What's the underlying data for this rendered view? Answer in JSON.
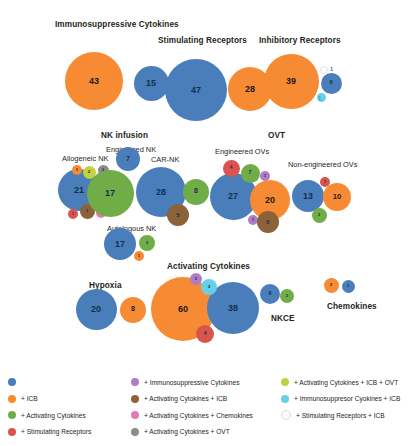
{
  "figure": {
    "title": "",
    "width": 420,
    "height": 446
  },
  "colors": {
    "blue": "#4a7ebb",
    "orange": "#f68b33",
    "green": "#70ad47",
    "red": "#d9534f",
    "purple": "#b07cc6",
    "brown": "#8c6239",
    "pink": "#e07ab0",
    "gray": "#8c8c8c",
    "yellow_green": "#c3d13f",
    "cyan": "#67d0e8",
    "white": "#fdfdfd"
  },
  "group_labels": [
    {
      "text": "Immunosuppressive Cytokines",
      "x": 55,
      "y": 20,
      "type": "main"
    },
    {
      "text": "Stimulating Receptors",
      "x": 158,
      "y": 36,
      "type": "main"
    },
    {
      "text": "Inhibitory Receptors",
      "x": 259,
      "y": 36,
      "type": "main"
    },
    {
      "text": "NK infusion",
      "x": 101,
      "y": 131,
      "type": "main"
    },
    {
      "text": "OVT",
      "x": 268,
      "y": 131,
      "type": "main"
    },
    {
      "text": "Activating Cytokines",
      "x": 167,
      "y": 262,
      "type": "main"
    },
    {
      "text": "Chemokines",
      "x": 327,
      "y": 302,
      "type": "main"
    },
    {
      "text": "NKCE",
      "x": 271,
      "y": 314,
      "type": "main"
    },
    {
      "text": "Hypoxia",
      "x": 89,
      "y": 281,
      "type": "main"
    },
    {
      "text": "Engineered NK",
      "x": 106,
      "y": 145,
      "type": "sub"
    },
    {
      "text": "Allogeneic NK",
      "x": 62,
      "y": 154,
      "type": "sub"
    },
    {
      "text": "CAR-NK",
      "x": 151,
      "y": 155,
      "type": "sub"
    },
    {
      "text": "Engineered OVs",
      "x": 215,
      "y": 147,
      "type": "sub"
    },
    {
      "text": "Non-engineered OVs",
      "x": 288,
      "y": 160,
      "type": "sub"
    },
    {
      "text": "Autologous NK",
      "x": 107,
      "y": 224,
      "type": "sub"
    }
  ],
  "chart_data": {
    "type": "bubble",
    "title": "",
    "xlabel": "",
    "ylabel": "",
    "grid": false,
    "legend_position": "bottom",
    "value_encoding": "bubble area proportional to count",
    "bubbles": [
      {
        "group": "Immunosuppressive Cytokines",
        "category": "base",
        "value": 43,
        "color": "orange",
        "cx": 94,
        "cy": 81,
        "r": 29
      },
      {
        "group": "Immunosuppressive Cytokines",
        "category": "+ ICB",
        "value": 15,
        "color": "blue",
        "cx": 151,
        "cy": 83,
        "r": 17.5
      },
      {
        "group": "Stimulating Receptors",
        "category": "base",
        "value": 47,
        "color": "blue",
        "cx": 196,
        "cy": 90,
        "r": 31
      },
      {
        "group": "Stimulating Receptors",
        "category": "+ ICB",
        "value": 28,
        "color": "orange",
        "cx": 250,
        "cy": 89,
        "r": 22
      },
      {
        "group": "Inhibitory Receptors",
        "category": "base",
        "value": 39,
        "color": "orange",
        "cx": 291,
        "cy": 81,
        "r": 27.5
      },
      {
        "group": "Inhibitory Receptors",
        "category": "+ ICB",
        "value": 6,
        "color": "blue",
        "cx": 331,
        "cy": 83,
        "r": 10.5
      },
      {
        "group": "Inhibitory Receptors",
        "category": "+ Stimulating Receptors + ICB",
        "value": 1,
        "color": "white",
        "cx": 324,
        "cy": 70,
        "r": 4,
        "label_outside": true,
        "label_x": 330,
        "label_y": 66
      },
      {
        "group": "Inhibitory Receptors",
        "category": "+ Immunosuppresor Cyokines + ICB",
        "value": 1,
        "color": "cyan",
        "cx": 321,
        "cy": 97,
        "r": 4.5,
        "label_outside": true,
        "label_x": 318,
        "label_y": 95,
        "label_cyan": true
      },
      {
        "group": "Allogeneic NK",
        "category": "base",
        "value": 21,
        "color": "blue",
        "cx": 79,
        "cy": 190,
        "r": 21
      },
      {
        "group": "Allogeneic NK",
        "category": "+ ICB",
        "value": 1,
        "color": "orange",
        "cx": 77,
        "cy": 170,
        "r": 5
      },
      {
        "group": "Allogeneic NK",
        "category": "+ Activating Cytokines + ICB + OVT",
        "value": 2,
        "color": "yellow_green",
        "cx": 89,
        "cy": 172,
        "r": 6.5
      },
      {
        "group": "Allogeneic NK",
        "category": "+ Activating Cytokines + OVT",
        "value": 3,
        "color": "gray",
        "cx": 103,
        "cy": 170,
        "r": 5.5
      },
      {
        "group": "Allogeneic NK",
        "category": "+ Stimulating Receptors",
        "value": 1,
        "color": "red",
        "cx": 73,
        "cy": 214,
        "r": 5
      },
      {
        "group": "Allogeneic NK",
        "category": "+ Activating Cytokines + ICB",
        "value": 3,
        "color": "brown",
        "cx": 87,
        "cy": 211,
        "r": 7.5
      },
      {
        "group": "Allogeneic NK",
        "category": "+ Activating Cytokines + Chemokines",
        "value": 1,
        "color": "pink",
        "cx": 101,
        "cy": 213,
        "r": 5
      },
      {
        "group": "Engineered NK",
        "category": "base",
        "value": 7,
        "color": "blue",
        "cx": 128,
        "cy": 159,
        "r": 12
      },
      {
        "group": "Engineered NK",
        "category": "+ Activating Cytokines",
        "value": 17,
        "color": "green",
        "cx": 110,
        "cy": 193,
        "r": 23.5
      },
      {
        "group": "CAR-NK",
        "category": "base",
        "value": 28,
        "color": "blue",
        "cx": 161,
        "cy": 192,
        "r": 25
      },
      {
        "group": "CAR-NK",
        "category": "+ Activating Cytokines",
        "value": 8,
        "color": "green",
        "cx": 196,
        "cy": 192,
        "r": 13
      },
      {
        "group": "CAR-NK",
        "category": "+ Activating Cytokines + ICB",
        "value": 5,
        "color": "brown",
        "cx": 178,
        "cy": 215,
        "r": 11
      },
      {
        "group": "Autologous NK",
        "category": "base",
        "value": 17,
        "color": "blue",
        "cx": 120,
        "cy": 244,
        "r": 16
      },
      {
        "group": "Autologous NK",
        "category": "+ Activating Cytokines",
        "value": 3,
        "color": "green",
        "cx": 147,
        "cy": 243,
        "r": 8
      },
      {
        "group": "Autologous NK",
        "category": "+ ICB",
        "value": 1,
        "color": "orange",
        "cx": 139,
        "cy": 256,
        "r": 5
      },
      {
        "group": "Engineered OVs",
        "category": "base",
        "value": 27,
        "color": "blue",
        "cx": 233,
        "cy": 196,
        "r": 23.5
      },
      {
        "group": "Engineered OVs",
        "category": "+ Stimulating Receptors",
        "value": 4,
        "color": "red",
        "cx": 231,
        "cy": 168,
        "r": 8.5
      },
      {
        "group": "Engineered OVs",
        "category": "+ Activating Cytokines",
        "value": 7,
        "color": "green",
        "cx": 250,
        "cy": 173,
        "r": 9.5
      },
      {
        "group": "Engineered OVs",
        "category": "+ Immunosuppressive Cytokines",
        "value": 1,
        "color": "purple",
        "cx": 265,
        "cy": 176,
        "r": 5
      },
      {
        "group": "Engineered OVs",
        "category": "+ ICB",
        "value": 20,
        "color": "orange",
        "cx": 270,
        "cy": 200,
        "r": 20
      },
      {
        "group": "Engineered OVs",
        "category": "+ Immunosuppressive Cytokines",
        "value": 1,
        "color": "purple",
        "cx": 253,
        "cy": 220,
        "r": 5
      },
      {
        "group": "Engineered OVs",
        "category": "+ Activating Cytokines + ICB",
        "value": 5,
        "color": "brown",
        "cx": 268,
        "cy": 222,
        "r": 11
      },
      {
        "group": "Non-engineered OVs",
        "category": "base",
        "value": 13,
        "color": "blue",
        "cx": 308,
        "cy": 196,
        "r": 16
      },
      {
        "group": "Non-engineered OVs",
        "category": "+ ICB",
        "value": 10,
        "color": "orange",
        "cx": 337,
        "cy": 197,
        "r": 14
      },
      {
        "group": "Non-engineered OVs",
        "category": "+ Stimulating Receptors",
        "value": 1,
        "color": "red",
        "cx": 325,
        "cy": 182,
        "r": 5
      },
      {
        "group": "Non-engineered OVs",
        "category": "+ Activating Cytokines",
        "value": 3,
        "color": "green",
        "cx": 319,
        "cy": 215,
        "r": 7.5
      },
      {
        "group": "Hypoxia",
        "category": "base",
        "value": 20,
        "color": "blue",
        "cx": 96,
        "cy": 309,
        "r": 20.5
      },
      {
        "group": "Hypoxia",
        "category": "+ ICB",
        "value": 8,
        "color": "orange",
        "cx": 133,
        "cy": 310,
        "r": 13
      },
      {
        "group": "Activating Cytokines",
        "category": "base",
        "value": 60,
        "color": "orange",
        "cx": 183,
        "cy": 309,
        "r": 32
      },
      {
        "group": "Activating Cytokines",
        "category": "+ ICB",
        "value": 38,
        "color": "blue",
        "cx": 233,
        "cy": 308,
        "r": 26
      },
      {
        "group": "Activating Cytokines",
        "category": "+ Immunosuppressive Cytokines",
        "value": 2,
        "color": "purple",
        "cx": 196,
        "cy": 279,
        "r": 6
      },
      {
        "group": "Activating Cytokines",
        "category": "+ Immunosuppresor Cyokines + ICB",
        "value": 3,
        "color": "cyan",
        "cx": 209,
        "cy": 287,
        "r": 8
      },
      {
        "group": "Activating Cytokines",
        "category": "+ Stimulating Receptors",
        "value": 4,
        "color": "red",
        "cx": 205,
        "cy": 334,
        "r": 9
      },
      {
        "group": "NKCE",
        "category": "base",
        "value": 6,
        "color": "blue",
        "cx": 270,
        "cy": 294,
        "r": 10
      },
      {
        "group": "NKCE",
        "category": "+ Activating Cytokines",
        "value": 2,
        "color": "green",
        "cx": 287,
        "cy": 296,
        "r": 7
      },
      {
        "group": "Chemokines",
        "category": "+ ICB",
        "value": 3,
        "color": "orange",
        "cx": 331,
        "cy": 285,
        "r": 7.5
      },
      {
        "group": "Chemokines",
        "category": "base",
        "value": 2,
        "color": "blue",
        "cx": 348,
        "cy": 286,
        "r": 6.5
      }
    ],
    "legend": {
      "columns": [
        [
          {
            "label": "",
            "color": "blue"
          },
          {
            "label": "+ ICB",
            "color": "orange"
          },
          {
            "label": "+ Activating Cytokines",
            "color": "green"
          },
          {
            "label": "+ Stimulating Receptors",
            "color": "red"
          }
        ],
        [
          {
            "label": "+ Immunosuppressive Cytokines",
            "color": "purple"
          },
          {
            "label": "+ Activating Cytokines + ICB",
            "color": "brown"
          },
          {
            "label": "+ Activating Cytokines + Chemokines",
            "color": "pink"
          },
          {
            "label": "+ Activating Cytokines + OVT",
            "color": "gray"
          }
        ],
        [
          {
            "label": "+ Activating Cytokines + ICB + OVT",
            "color": "yellow_green"
          },
          {
            "label": "+ Immunosuppresor Cyokines + ICB",
            "color": "cyan"
          },
          {
            "label": "+ Stimulating Receptors + ICB",
            "color": "white"
          }
        ]
      ]
    }
  }
}
